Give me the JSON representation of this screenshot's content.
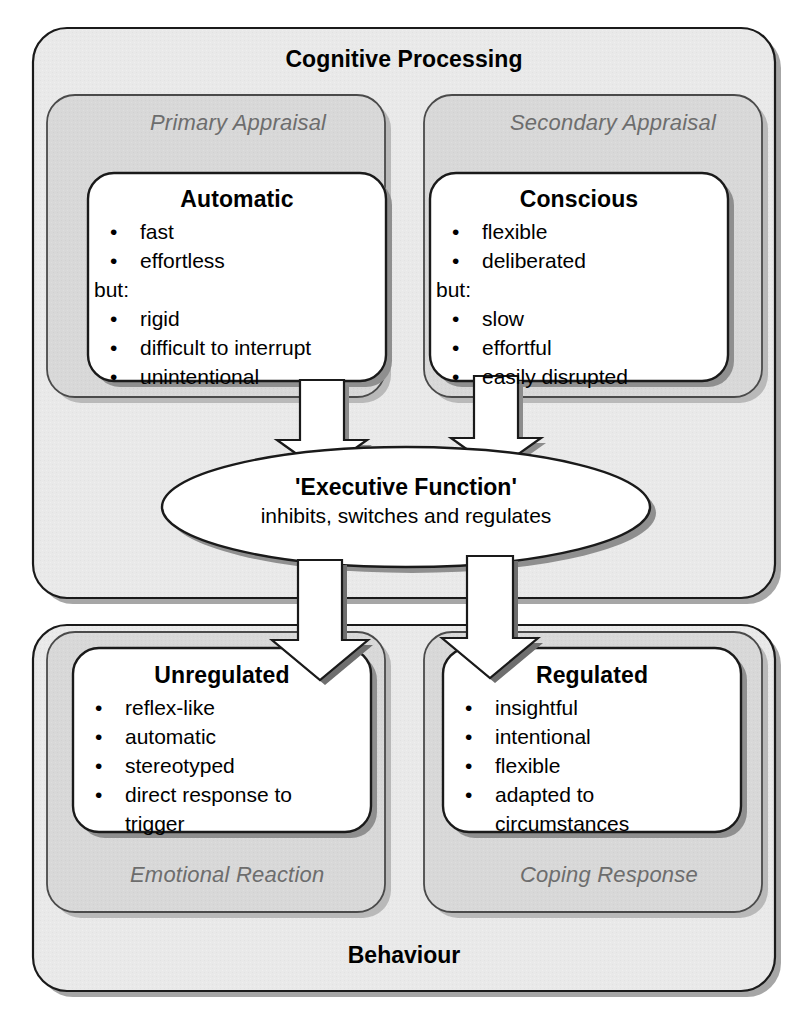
{
  "diagram": {
    "title_top": "Cognitive Processing",
    "title_bottom": "Behaviour",
    "colors": {
      "outer_fill": "#e8e8e8",
      "inner_fill": "#d6d6d6",
      "card_fill": "#ffffff",
      "stroke": "#1a1a1a",
      "shadow": "#9a9a9a",
      "label_grey": "#6d6d6d",
      "text": "#000000"
    },
    "top_section": {
      "label": "Cognitive Processing",
      "panels": [
        {
          "label": "Primary Appraisal",
          "card": {
            "title": "Automatic",
            "pros": [
              "fast",
              "effortless"
            ],
            "conjunction": "but:",
            "cons": [
              "rigid",
              "difficult to interrupt",
              "unintentional"
            ]
          }
        },
        {
          "label": "Secondary Appraisal",
          "card": {
            "title": "Conscious",
            "pros": [
              "flexible",
              "deliberated"
            ],
            "conjunction": "but:",
            "cons": [
              "slow",
              "effortful",
              "easily disrupted"
            ]
          }
        }
      ]
    },
    "hub": {
      "title": "'Executive Function'",
      "subtitle": "inhibits, switches and regulates"
    },
    "bottom_section": {
      "label": "Behaviour",
      "panels": [
        {
          "label": "Emotional Reaction",
          "card": {
            "title": "Unregulated",
            "items": [
              "reflex-like",
              "automatic",
              "stereotyped",
              "direct response to trigger"
            ]
          }
        },
        {
          "label": "Coping Response",
          "card": {
            "title": "Regulated",
            "items": [
              "insightful",
              "intentional",
              "flexible",
              "adapted to circumstances"
            ]
          }
        }
      ]
    },
    "arrows": [
      {
        "name": "automatic-to-executive",
        "from": "Automatic",
        "to": "'Executive Function'",
        "direction": "down"
      },
      {
        "name": "conscious-to-executive",
        "from": "Conscious",
        "to": "'Executive Function'",
        "direction": "down"
      },
      {
        "name": "executive-to-unregulated",
        "from": "'Executive Function'",
        "to": "Unregulated",
        "direction": "down"
      },
      {
        "name": "executive-to-regulated",
        "from": "'Executive Function'",
        "to": "Regulated",
        "direction": "down"
      }
    ],
    "bullet_glyph": "•"
  }
}
